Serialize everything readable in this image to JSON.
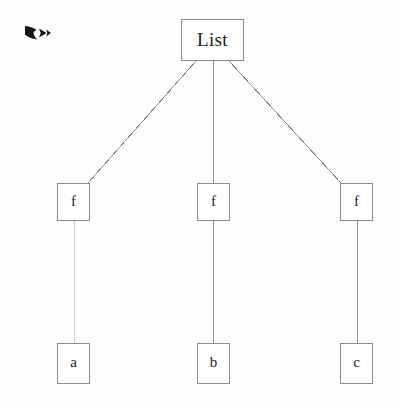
{
  "figure": {
    "type": "tree-diagram",
    "background_color": "#fefefe",
    "line_color": "#8e8e8e",
    "text_color": "#1b1b1b"
  },
  "marker": {
    "icon": "black-right-arrow-bullet-icon",
    "color": "#111111"
  },
  "tree": {
    "root": {
      "label": "List"
    },
    "middle": [
      {
        "label": "f"
      },
      {
        "label": "f"
      },
      {
        "label": "f"
      }
    ],
    "leaves": [
      {
        "label": "a"
      },
      {
        "label": "b"
      },
      {
        "label": "c"
      }
    ]
  },
  "edges": [
    {
      "from": "List",
      "to": "f-0",
      "style": "solid"
    },
    {
      "from": "List",
      "to": "f-1",
      "style": "solid"
    },
    {
      "from": "List",
      "to": "f-2",
      "style": "solid"
    },
    {
      "from": "f-0",
      "to": "a",
      "style": "dotted"
    },
    {
      "from": "f-1",
      "to": "b",
      "style": "solid"
    },
    {
      "from": "f-2",
      "to": "c",
      "style": "solid"
    }
  ]
}
